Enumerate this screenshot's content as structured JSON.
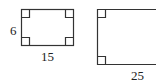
{
  "figure": {
    "left_rectangle": {
      "height_label": "6",
      "width_label": "15",
      "right_angle_marks": 4
    },
    "right_rectangle": {
      "width_label": "25",
      "right_angle_marks": 2,
      "partially_visible": true
    },
    "colors": {
      "stroke": "#333333",
      "background": "#ffffff"
    }
  }
}
